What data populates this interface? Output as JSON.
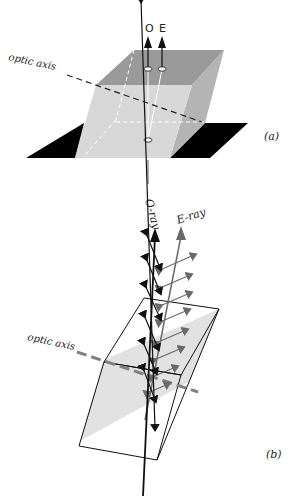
{
  "figure": {
    "panel_a": {
      "label": "(a)",
      "optic_axis_label": "optic axis",
      "ray_labels": {
        "ordinary": "O",
        "extraordinary": "E"
      }
    },
    "panel_b": {
      "label": "(b)",
      "optic_axis_label": "optic axis",
      "ray_labels": {
        "ordinary": "O-ray",
        "extraordinary": "E-ray"
      }
    }
  },
  "colors": {
    "crystal_top": "#9a9a9a",
    "crystal_front": "#d6d6d6",
    "crystal_side": "#b4b4b4",
    "plate": "#000000",
    "o_ray": "#111111",
    "e_ray": "#6a6a6a",
    "optic_axis_b": "#808080",
    "plane_fill": "#e0e0e0"
  }
}
